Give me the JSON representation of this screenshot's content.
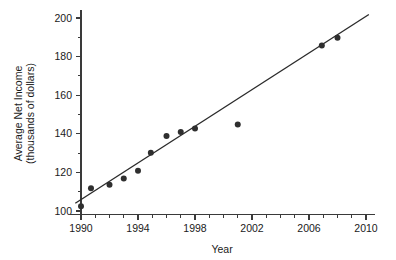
{
  "chart_data": {
    "type": "scatter",
    "title": "",
    "xlabel": "Year",
    "ylabel": "Average Net Income (thousands of dollars)",
    "ylabel_line1": "Average Net Income",
    "ylabel_line2": "(thousands of dollars)",
    "xlim": [
      1989.2,
      2010.6
    ],
    "ylim": [
      98,
      203
    ],
    "grid": false,
    "legend": "none",
    "x_ticks_major": [
      1990,
      1994,
      1998,
      2002,
      2006,
      2010
    ],
    "x_tick_labels": [
      "1990",
      "1994",
      "1998",
      "2002",
      "2006",
      "2010"
    ],
    "x_ticks_minor": [
      1991,
      1992,
      1993,
      1995,
      1996,
      1997,
      1999,
      2000,
      2001,
      2003,
      2004,
      2005,
      2007,
      2008,
      2009
    ],
    "y_ticks_major": [
      100,
      120,
      140,
      160,
      180,
      200
    ],
    "y_tick_labels": [
      "100",
      "120",
      "140",
      "160",
      "180",
      "200"
    ],
    "y_ticks_minor": [
      110,
      130,
      150,
      170,
      190
    ],
    "points": [
      {
        "x": 1990.0,
        "y": 102.5
      },
      {
        "x": 1990.7,
        "y": 111.8
      },
      {
        "x": 1992.0,
        "y": 113.6
      },
      {
        "x": 1993.0,
        "y": 116.9
      },
      {
        "x": 1994.0,
        "y": 120.9
      },
      {
        "x": 1994.9,
        "y": 130.2
      },
      {
        "x": 1996.0,
        "y": 138.9
      },
      {
        "x": 1997.0,
        "y": 140.9
      },
      {
        "x": 1998.0,
        "y": 142.8
      },
      {
        "x": 2001.0,
        "y": 144.8
      },
      {
        "x": 2006.9,
        "y": 185.7
      },
      {
        "x": 2008.0,
        "y": 189.8
      }
    ],
    "point_color": "#2f2f2f",
    "point_size": 3.0,
    "trend_line": {
      "x_start": 1989.6,
      "y_start": 104.0,
      "x_end": 2010.2,
      "y_end": 201.8,
      "color": "#2b2b2b"
    },
    "axis_color": "#3a3a3a"
  }
}
